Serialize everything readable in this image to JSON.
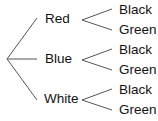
{
  "diagram": {
    "type": "tree",
    "root": "",
    "level1": [
      {
        "label": "Red",
        "children": [
          "Black",
          "Green"
        ]
      },
      {
        "label": "Blue",
        "children": [
          "Black",
          "Green"
        ]
      },
      {
        "label": "White",
        "children": [
          "Black",
          "Green"
        ]
      }
    ],
    "line_color": "#555555"
  }
}
